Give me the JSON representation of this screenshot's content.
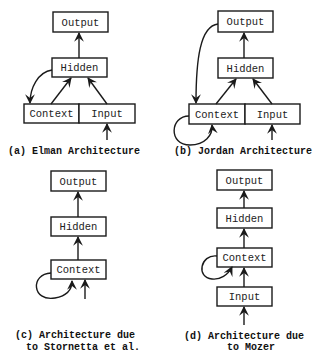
{
  "diagram": {
    "panels": [
      {
        "id": "a",
        "caption": [
          "(a) Elman Architecture"
        ],
        "nodes": [
          "Output",
          "Hidden",
          "Context",
          "Input"
        ],
        "edges": [
          "Input->Hidden",
          "Context->Hidden",
          "Hidden->Output",
          "Hidden->Context",
          "external->Input"
        ]
      },
      {
        "id": "b",
        "caption": [
          "(b) Jordan Architecture"
        ],
        "nodes": [
          "Output",
          "Hidden",
          "Context",
          "Input"
        ],
        "edges": [
          "Input->Hidden",
          "Context->Hidden",
          "Hidden->Output",
          "Output->Context",
          "Context->Context",
          "external->Input"
        ]
      },
      {
        "id": "c",
        "caption": [
          "(c) Architecture due",
          "to Stornetta et al."
        ],
        "nodes": [
          "Output",
          "Hidden",
          "Context"
        ],
        "edges": [
          "Context->Hidden",
          "Hidden->Output",
          "Context->Context",
          "external->Context"
        ]
      },
      {
        "id": "d",
        "caption": [
          "(d) Architecture due",
          "to Mozer"
        ],
        "nodes": [
          "Output",
          "Hidden",
          "Context",
          "Input"
        ],
        "edges": [
          "Input->Context",
          "Context->Hidden",
          "Hidden->Output",
          "Context->Context",
          "external->Input"
        ]
      }
    ]
  }
}
